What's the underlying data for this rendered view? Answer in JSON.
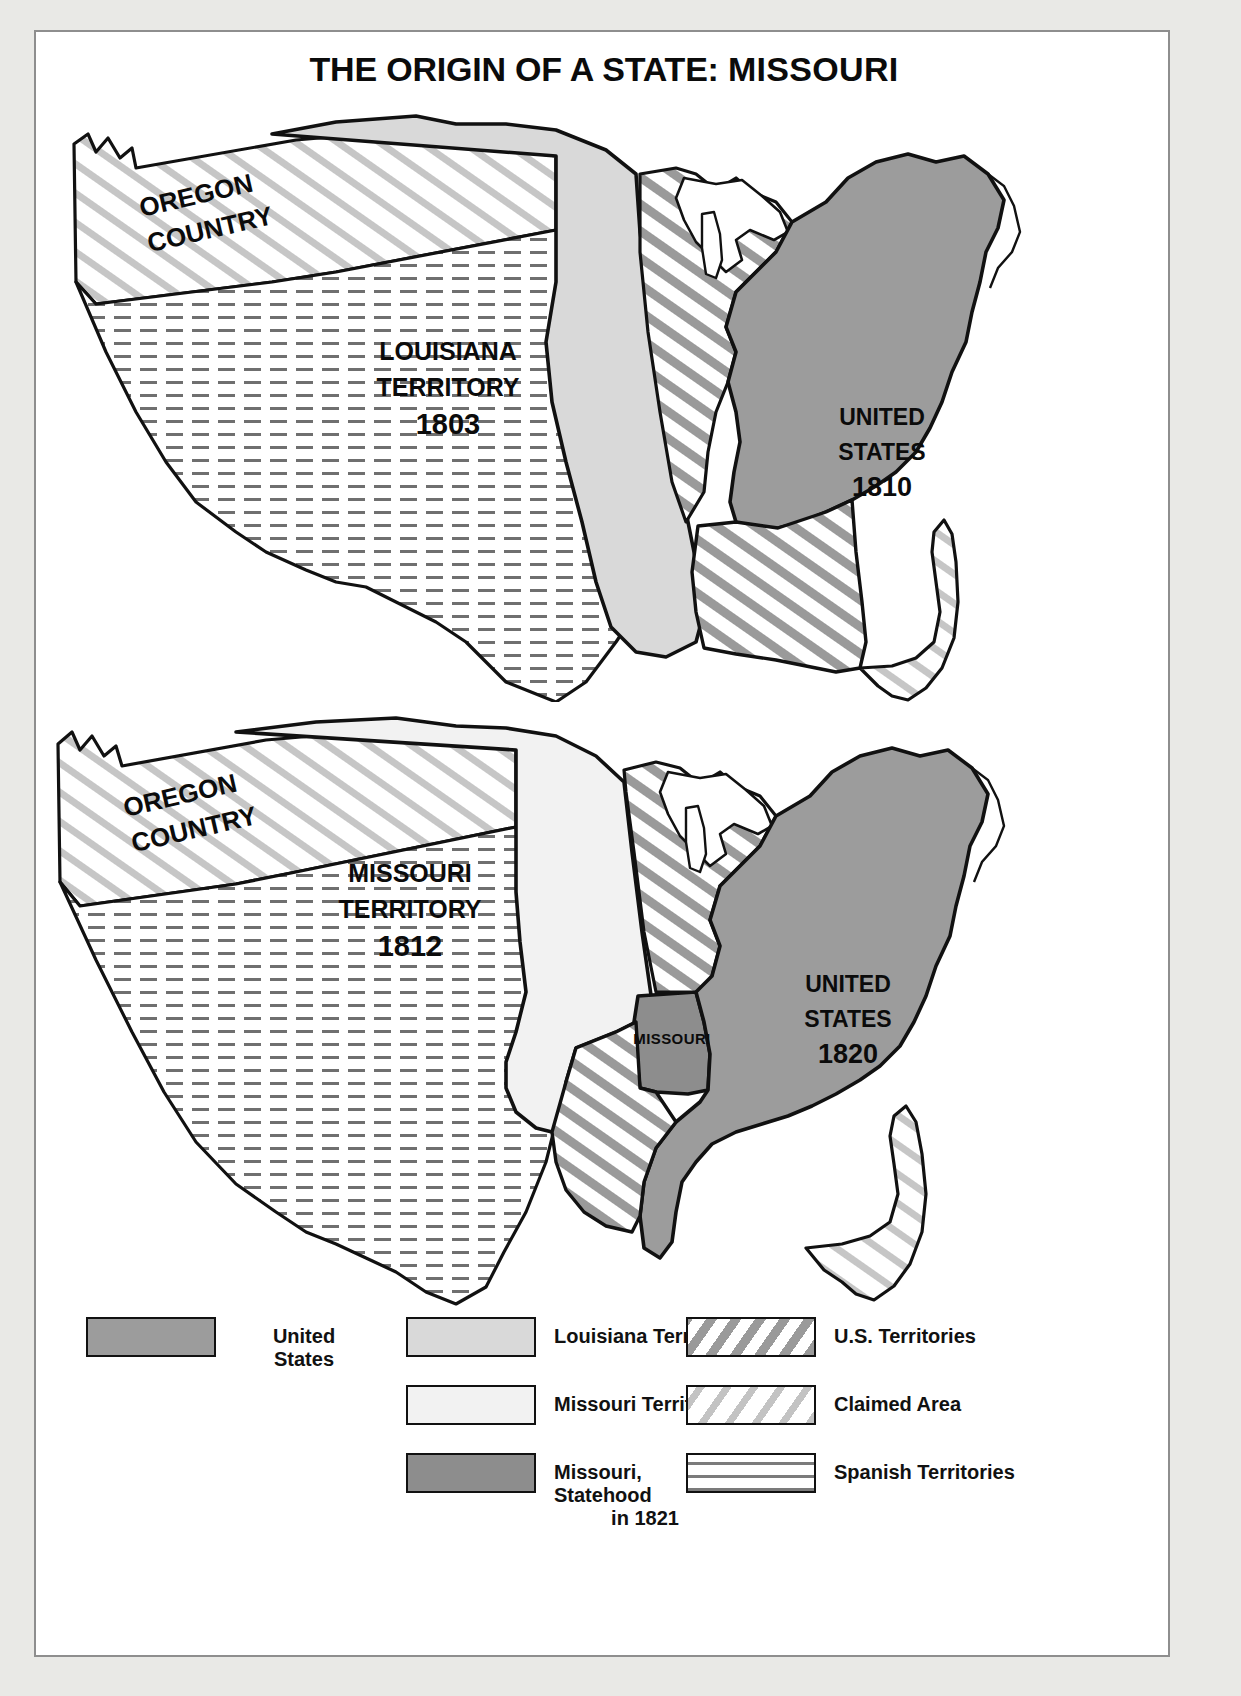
{
  "title": {
    "part1": "THE ORIGIN OF A STATE: ",
    "part2": "MISSOURI",
    "full": "THE ORIGIN OF A STATE: MISSOURI"
  },
  "maps": [
    {
      "id": "map-1803-1810",
      "labels": {
        "oregon_line1": "OREGON",
        "oregon_line2": "COUNTRY",
        "territory_line1": "LOUISIANA",
        "territory_line2": "TERRITORY",
        "territory_year": "1803",
        "us_line1": "UNITED",
        "us_line2": "STATES",
        "us_year": "1810"
      }
    },
    {
      "id": "map-1812-1820",
      "labels": {
        "oregon_line1": "OREGON",
        "oregon_line2": "COUNTRY",
        "territory_line1": "MISSOURI",
        "territory_line2": "TERRITORY",
        "territory_year": "1812",
        "us_line1": "UNITED",
        "us_line2": "STATES",
        "us_year": "1820",
        "state_label": "MISSOURI"
      }
    }
  ],
  "legend": {
    "columns": [
      {
        "items": [
          {
            "label_line1": "United",
            "label_line2": "States",
            "swatch": "sw-us",
            "name": "united-states"
          }
        ]
      },
      {
        "items": [
          {
            "label_line1": "Louisiana Territory",
            "label_line2": "",
            "swatch": "sw-la",
            "name": "louisiana-territory"
          },
          {
            "label_line1": "Missouri Territory",
            "label_line2": "",
            "swatch": "sw-mo",
            "name": "missouri-territory"
          },
          {
            "label_line1": "Missouri, Statehood",
            "label_line2": "in 1821",
            "swatch": "sw-mostate",
            "name": "missouri-statehood"
          }
        ]
      },
      {
        "items": [
          {
            "label_line1": "U.S. Territories",
            "label_line2": "",
            "swatch": "sw-usterr",
            "name": "us-territories"
          },
          {
            "label_line1": "Claimed Area",
            "label_line2": "",
            "swatch": "sw-claimed",
            "name": "claimed-area"
          },
          {
            "label_line1": "Spanish Territories",
            "label_line2": "",
            "swatch": "sw-spanish",
            "name": "spanish-territories"
          }
        ]
      }
    ]
  },
  "colors": {
    "united_states": "#9c9c9c",
    "louisiana_territory": "#d9d9d9",
    "missouri_territory": "#f2f2f2",
    "missouri_state": "#8d8d8d",
    "us_territories_hatch": "#9a9a9a",
    "claimed_area_hatch": "#c3c3c3",
    "spanish_hatch": "#7b7b7b",
    "outline": "#111111",
    "page_background": "#e9e9e6",
    "sheet": "#ffffff"
  }
}
